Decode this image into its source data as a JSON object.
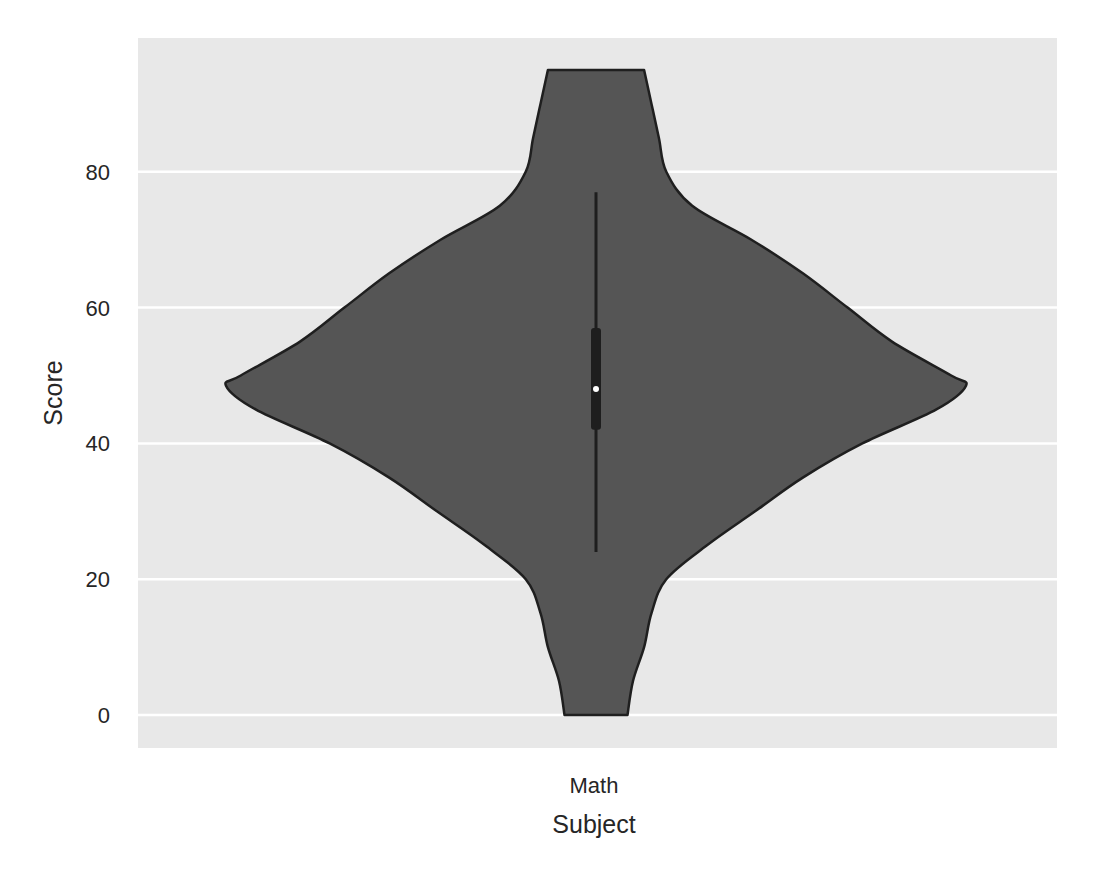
{
  "chart_data": {
    "type": "violin",
    "title": "",
    "xlabel": "Subject",
    "ylabel": "Score",
    "categories": [
      "Math"
    ],
    "yticks": [
      0,
      20,
      40,
      60,
      80
    ],
    "ylim": [
      -5,
      100
    ],
    "grid": true,
    "legend": null,
    "series": [
      {
        "name": "Math",
        "data_min": 0,
        "data_max": 95,
        "whisker_low": 24,
        "q1": 42,
        "median": 48,
        "q3": 57,
        "whisker_high": 77,
        "density_profile": [
          {
            "y": 95,
            "half_width": 0.13
          },
          {
            "y": 90,
            "half_width": 0.15
          },
          {
            "y": 85,
            "half_width": 0.17
          },
          {
            "y": 80,
            "half_width": 0.19
          },
          {
            "y": 75,
            "half_width": 0.26
          },
          {
            "y": 70,
            "half_width": 0.42
          },
          {
            "y": 65,
            "half_width": 0.56
          },
          {
            "y": 60,
            "half_width": 0.68
          },
          {
            "y": 55,
            "half_width": 0.8
          },
          {
            "y": 50,
            "half_width": 0.96
          },
          {
            "y": 48.5,
            "half_width": 1.0
          },
          {
            "y": 45,
            "half_width": 0.92
          },
          {
            "y": 40,
            "half_width": 0.72
          },
          {
            "y": 35,
            "half_width": 0.56
          },
          {
            "y": 30,
            "half_width": 0.43
          },
          {
            "y": 25,
            "half_width": 0.3
          },
          {
            "y": 20,
            "half_width": 0.19
          },
          {
            "y": 15,
            "half_width": 0.15
          },
          {
            "y": 10,
            "half_width": 0.13
          },
          {
            "y": 5,
            "half_width": 0.1
          },
          {
            "y": 0,
            "half_width": 0.085
          }
        ]
      }
    ]
  },
  "colors": {
    "plot_background": "#e8e8e8",
    "gridline": "#ffffff",
    "violin_fill": "#555555",
    "violin_edge": "#1f1f1f",
    "box": "#1e1e1e",
    "median_dot": "#ffffff",
    "text": "#262626"
  }
}
